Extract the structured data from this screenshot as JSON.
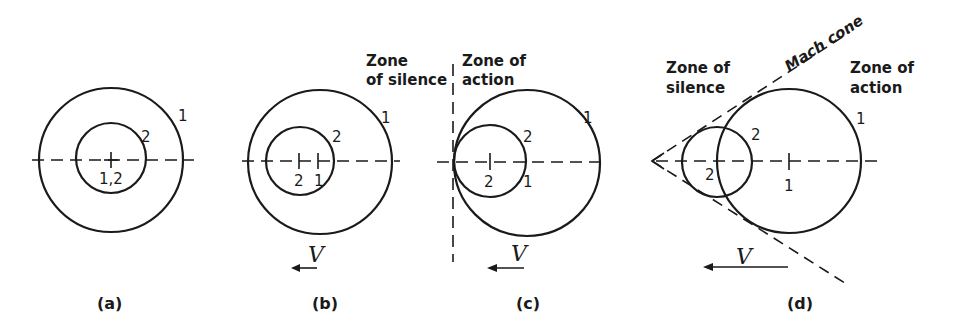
{
  "figure": {
    "colors": {
      "ink": "#1a1a1a",
      "background": "#ffffff"
    },
    "panels": [
      {
        "id": "a",
        "caption": "(a)",
        "case": "stationary source",
        "wavefront_labels": [
          "1",
          "2"
        ],
        "center_labels": [
          "1,2"
        ]
      },
      {
        "id": "b",
        "caption": "(b)",
        "case": "subsonic source",
        "wavefront_labels": [
          "1",
          "2"
        ],
        "center_labels": [
          "2",
          "1"
        ],
        "velocity_symbol": "V"
      },
      {
        "id": "c",
        "caption": "(c)",
        "case": "sonic source",
        "wavefront_labels": [
          "1",
          "2"
        ],
        "center_labels": [
          "2",
          "1"
        ],
        "velocity_symbol": "V",
        "zone_left": {
          "line1": "Zone",
          "line2": "of silence"
        },
        "zone_right": {
          "line1": "Zone of",
          "line2": "action"
        }
      },
      {
        "id": "d",
        "caption": "(d)",
        "case": "supersonic source",
        "wavefront_labels": [
          "1",
          "2"
        ],
        "center_labels": [
          "2",
          "1"
        ],
        "velocity_symbol": "V",
        "mach_cone_label": "Mach cone",
        "zone_left": {
          "line1": "Zone of",
          "line2": "silence"
        },
        "zone_right": {
          "line1": "Zone of",
          "line2": "action"
        }
      }
    ]
  }
}
